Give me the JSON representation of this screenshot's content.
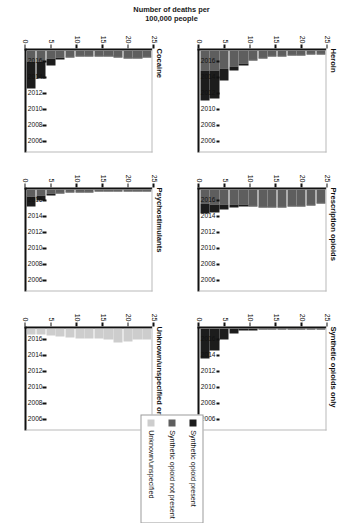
{
  "figure": {
    "ylabel": "Number of deaths per\n100,000 people",
    "ylabel_line1": "Number of deaths per",
    "ylabel_line2": "100,000 people"
  },
  "legend": {
    "items": [
      {
        "label": "Synthetic opioid present",
        "color": "#1c1c1c",
        "name": "legend-synthetic-present"
      },
      {
        "label": "Synthetic opioid not present",
        "color": "#5e5e5e",
        "name": "legend-synthetic-not-present"
      },
      {
        "label": "Unknown/unspecified",
        "color": "#cdcdcd",
        "name": "legend-unknown-unspecified"
      }
    ]
  },
  "chart_data": {
    "type": "bar",
    "title": "",
    "xlabel": "",
    "ylabel": "Number of deaths per 100,000 people",
    "ylim": [
      0,
      25
    ],
    "yticks": [
      0,
      5,
      10,
      15,
      20,
      25
    ],
    "grid": false,
    "legend_position": "right",
    "orientation": "horizontal-bars",
    "x": [
      2005,
      2006,
      2007,
      2008,
      2009,
      2010,
      2011,
      2012,
      2013,
      2014,
      2015,
      2016,
      2017
    ],
    "xtick_labels": [
      "2006",
      "2008",
      "2010",
      "2012",
      "2014",
      "2016"
    ],
    "xtick_values": [
      2006,
      2008,
      2010,
      2012,
      2014,
      2016
    ],
    "panels": [
      {
        "title": "Heroin",
        "series": [
          {
            "name": "Synthetic opioid not present",
            "color": "#5e5e5e",
            "values": [
              0.8,
              0.8,
              1.1,
              1.1,
              1.2,
              1.3,
              1.8,
              2.2,
              3.2,
              4.0,
              4.5,
              5.0,
              5.0
            ]
          },
          {
            "name": "Synthetic opioid present",
            "color": "#1c1c1c",
            "values": [
              0.05,
              0.05,
              0.1,
              0.1,
              0.1,
              0.1,
              0.2,
              0.3,
              0.5,
              1.0,
              3.0,
              7.0,
              7.5
            ]
          }
        ],
        "totals": [
          0.85,
          0.85,
          1.2,
          1.2,
          1.3,
          1.4,
          2.0,
          2.5,
          3.7,
          5.0,
          7.5,
          12.0,
          12.5
        ]
      },
      {
        "title": "Prescription opioids",
        "series": [
          {
            "name": "Synthetic opioid not present",
            "color": "#5e5e5e",
            "values": [
              3.2,
              3.6,
              4.0,
              4.0,
              4.2,
              4.2,
              4.3,
              4.0,
              3.8,
              3.8,
              3.7,
              3.6,
              3.4
            ]
          },
          {
            "name": "Synthetic opioid present",
            "color": "#1c1c1c",
            "values": [
              0.1,
              0.1,
              0.1,
              0.15,
              0.15,
              0.2,
              0.2,
              0.25,
              0.4,
              0.6,
              1.2,
              2.2,
              2.6
            ]
          }
        ],
        "totals": [
          3.3,
          3.7,
          4.1,
          4.15,
          4.35,
          4.4,
          4.5,
          4.25,
          4.2,
          4.4,
          4.9,
          5.8,
          6.0
        ]
      },
      {
        "title": "Synthetic opioids only",
        "series": [
          {
            "name": "Synthetic opioid present",
            "color": "#1c1c1c",
            "values": [
              0.15,
              0.2,
              0.3,
              0.3,
              0.3,
              0.3,
              0.35,
              0.4,
              0.6,
              1.2,
              2.6,
              5.5,
              7.5
            ]
          }
        ],
        "totals": [
          0.15,
          0.2,
          0.3,
          0.3,
          0.3,
          0.3,
          0.35,
          0.4,
          0.6,
          1.2,
          2.6,
          5.5,
          7.5
        ]
      },
      {
        "title": "Cocaine",
        "series": [
          {
            "name": "Synthetic opioid not present",
            "color": "#5e5e5e",
            "values": [
              1.6,
              1.8,
              1.7,
              1.5,
              1.3,
              1.2,
              1.3,
              1.2,
              1.4,
              1.7,
              2.1,
              2.6,
              2.8
            ]
          },
          {
            "name": "Synthetic opioid present",
            "color": "#1c1c1c",
            "values": [
              0.05,
              0.05,
              0.1,
              0.1,
              0.1,
              0.1,
              0.1,
              0.15,
              0.3,
              0.6,
              1.6,
              4.4,
              6.5
            ]
          }
        ],
        "totals": [
          1.65,
          1.85,
          1.8,
          1.6,
          1.4,
          1.3,
          1.4,
          1.35,
          1.7,
          2.3,
          3.7,
          7.0,
          9.3
        ]
      },
      {
        "title": "Psychostimulants",
        "series": [
          {
            "name": "Synthetic opioid not present",
            "color": "#5e5e5e",
            "values": [
              0.2,
              0.2,
              0.25,
              0.25,
              0.3,
              0.3,
              0.4,
              0.5,
              0.6,
              0.8,
              1.1,
              1.5,
              1.8
            ]
          },
          {
            "name": "Synthetic opioid present",
            "color": "#1c1c1c",
            "values": [
              0.02,
              0.02,
              0.03,
              0.03,
              0.03,
              0.04,
              0.05,
              0.06,
              0.1,
              0.2,
              0.5,
              1.3,
              2.4
            ]
          }
        ],
        "totals": [
          0.22,
          0.22,
          0.28,
          0.28,
          0.33,
          0.34,
          0.45,
          0.56,
          0.7,
          1.0,
          1.6,
          2.8,
          4.2
        ]
      },
      {
        "title": "Unknown/unspecified only",
        "series": [
          {
            "name": "Unknown/unspecified",
            "color": "#cdcdcd",
            "values": [
              2.6,
              2.7,
              3.2,
              3.4,
              2.7,
              2.5,
              2.5,
              2.4,
              2.3,
              2.0,
              1.8,
              1.5,
              1.4
            ]
          }
        ],
        "totals": [
          2.6,
          2.7,
          3.2,
          3.4,
          2.7,
          2.5,
          2.5,
          2.4,
          2.3,
          2.0,
          1.8,
          1.5,
          1.4
        ]
      }
    ]
  }
}
